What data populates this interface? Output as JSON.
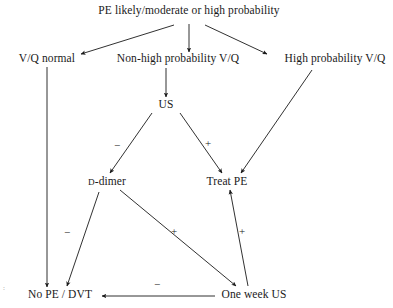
{
  "diagram": {
    "type": "flowchart",
    "title_text": "PE likely/moderate or high probability",
    "width": 393,
    "height": 308,
    "stroke_color": "#1a1a1a",
    "text_color": "#1a1a1a",
    "background": "#ffffff",
    "nodes": [
      {
        "id": "root",
        "label": "PE likely/moderate or high probability",
        "x": 189,
        "y": 11
      },
      {
        "id": "vq_normal",
        "label": "V/Q normal",
        "x": 47,
        "y": 59
      },
      {
        "id": "nonhigh",
        "label": "Non-high probability V/Q",
        "x": 178,
        "y": 59
      },
      {
        "id": "highprob",
        "label": "High probability V/Q",
        "x": 335,
        "y": 59
      },
      {
        "id": "us",
        "label": "US",
        "x": 166,
        "y": 105
      },
      {
        "id": "ddimer",
        "label_prefix": "D",
        "label_suffix": "-dimer",
        "x": 107,
        "y": 182
      },
      {
        "id": "treat_pe",
        "label": "Treat PE",
        "x": 227,
        "y": 182
      },
      {
        "id": "no_pe_dvt",
        "label": "No PE / DVT",
        "x": 60,
        "y": 295
      },
      {
        "id": "oneweek",
        "label": "One week US",
        "x": 254,
        "y": 295
      }
    ],
    "edges": [
      {
        "from": "root",
        "to": "vq_normal",
        "sign": ""
      },
      {
        "from": "root",
        "to": "nonhigh",
        "sign": ""
      },
      {
        "from": "root",
        "to": "highprob",
        "sign": ""
      },
      {
        "from": "nonhigh",
        "to": "us",
        "sign": ""
      },
      {
        "from": "us",
        "to": "ddimer",
        "sign": "−"
      },
      {
        "from": "us",
        "to": "treat_pe",
        "sign": "+"
      },
      {
        "from": "highprob",
        "to": "treat_pe",
        "sign": ""
      },
      {
        "from": "vq_normal",
        "to": "no_pe_dvt",
        "sign": ""
      },
      {
        "from": "ddimer",
        "to": "no_pe_dvt",
        "sign": "−"
      },
      {
        "from": "ddimer",
        "to": "oneweek",
        "sign": "+"
      },
      {
        "from": "oneweek",
        "to": "treat_pe",
        "sign": "+"
      },
      {
        "from": "oneweek",
        "to": "no_pe_dvt",
        "sign": "−"
      }
    ],
    "edge_labels": [
      {
        "id": "us-ddimer-sign",
        "text": "−",
        "x": 117,
        "y": 145
      },
      {
        "id": "us-treatpe-sign",
        "text": "+",
        "x": 208,
        "y": 143
      },
      {
        "id": "ddimer-nope-sign",
        "text": "−",
        "x": 67,
        "y": 232
      },
      {
        "id": "ddimer-oneweek-sign",
        "text": "+",
        "x": 174,
        "y": 231
      },
      {
        "id": "oneweek-treatpe-sign",
        "text": "+",
        "x": 242,
        "y": 231
      },
      {
        "id": "oneweek-nope-sign",
        "text": "−",
        "x": 157,
        "y": 284
      }
    ],
    "artifact": {
      "text": ":",
      "x": 4,
      "y": 288
    }
  }
}
